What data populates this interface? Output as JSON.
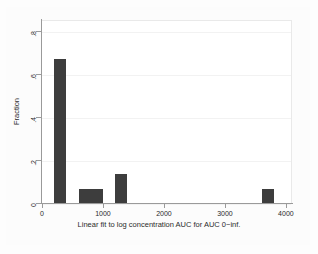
{
  "chart_data": {
    "type": "bar",
    "title": "",
    "subtitle": "",
    "xlabel": "Linear fit to log concentration AUC for AUC 0−inf.",
    "ylabel": "Fraction",
    "xlim": [
      0,
      4100
    ],
    "ylim": [
      0,
      0.85
    ],
    "grid": true,
    "legend": false,
    "x_ticks": [
      0,
      1000,
      2000,
      3000,
      4000
    ],
    "x_tick_labels": [
      "0",
      "1000",
      "2000",
      "3000",
      "4000"
    ],
    "y_ticks": [
      0,
      0.2,
      0.4,
      0.6,
      0.8
    ],
    "y_tick_labels": [
      "0",
      ".2",
      ".4",
      ".6",
      ".8"
    ],
    "bar_color": "#3d3d3d",
    "bin_width": 200,
    "bars": [
      {
        "label": "200–400",
        "x_left": 200,
        "x_right": 400,
        "value": 0.667
      },
      {
        "label": "600–800",
        "x_left": 600,
        "x_right": 800,
        "value": 0.067
      },
      {
        "label": "800–1000",
        "x_left": 800,
        "x_right": 1000,
        "value": 0.067
      },
      {
        "label": "1200–1400",
        "x_left": 1200,
        "x_right": 1400,
        "value": 0.133
      },
      {
        "label": "3600–3800",
        "x_left": 3600,
        "x_right": 3800,
        "value": 0.067
      }
    ],
    "categories": [
      "200–400",
      "600–800",
      "800–1000",
      "1200–1400",
      "3600–3800"
    ],
    "values": [
      0.667,
      0.067,
      0.067,
      0.133,
      0.067
    ]
  }
}
